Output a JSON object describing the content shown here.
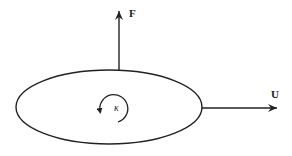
{
  "diagram": {
    "force_label": "F",
    "velocity_label": "U",
    "rotation_label": "κ",
    "stroke_color": "#222222",
    "background": "#ffffff"
  }
}
